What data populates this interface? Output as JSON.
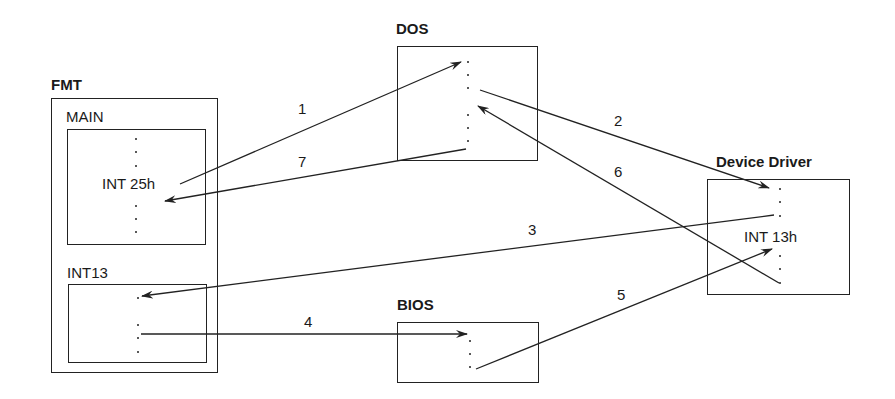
{
  "nodes": {
    "fmt": {
      "title": "FMT",
      "main": {
        "label": "MAIN",
        "call": "INT 25h"
      },
      "int13": {
        "label": "INT13"
      }
    },
    "dos": {
      "title": "DOS"
    },
    "device_driver": {
      "title": "Device Driver",
      "call": "INT 13h"
    },
    "bios": {
      "title": "BIOS"
    }
  },
  "edges": [
    {
      "id": "1",
      "from": "FMT.MAIN (INT 25h)",
      "to": "DOS"
    },
    {
      "id": "2",
      "from": "DOS",
      "to": "Device Driver"
    },
    {
      "id": "3",
      "from": "Device Driver",
      "to": "FMT.INT13"
    },
    {
      "id": "4",
      "from": "FMT.INT13",
      "to": "BIOS"
    },
    {
      "id": "5",
      "from": "BIOS",
      "to": "Device Driver (INT 13h)"
    },
    {
      "id": "6",
      "from": "Device Driver",
      "to": "DOS"
    },
    {
      "id": "7",
      "from": "DOS",
      "to": "FMT.MAIN"
    }
  ],
  "edge_labels": {
    "e1": "1",
    "e2": "2",
    "e3": "3",
    "e4": "4",
    "e5": "5",
    "e6": "6",
    "e7": "7"
  }
}
